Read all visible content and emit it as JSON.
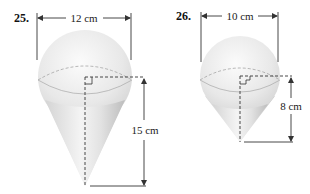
{
  "figures": [
    {
      "number": "25.",
      "diameter_label": "12 cm",
      "height_label": "15 cm",
      "shape": "sphere on cone"
    },
    {
      "number": "26.",
      "diameter_label": "10 cm",
      "height_label": "8 cm",
      "shape": "sphere on cone"
    }
  ],
  "colors": {
    "line": "#333333",
    "fill_light": "#f2f2f2",
    "fill_dark": "#c8c8c8"
  }
}
